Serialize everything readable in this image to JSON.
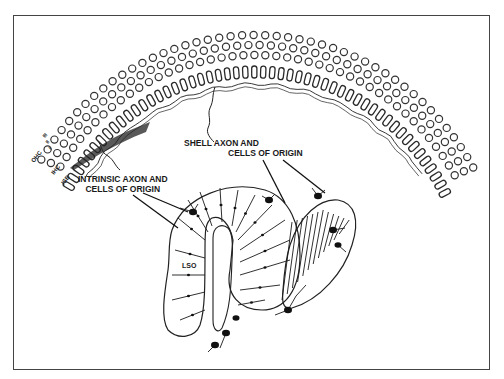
{
  "figure": {
    "type": "schematic diagram",
    "colors": {
      "ink": "#1a1a1a",
      "frame": "#444444",
      "background": "#ffffff"
    }
  },
  "labels": {
    "ohc": "OHC",
    "ohc_rows": [
      "III",
      "II",
      "I"
    ],
    "ihc": "IHC",
    "isb": "ISB",
    "lso": "LSO",
    "shell_line1": "SHELL AXON AND",
    "shell_line2": "CELLS OF ORIGIN",
    "intrinsic_line1": "INTRINSIC AXON AND",
    "intrinsic_line2": "CELLS OF ORIGIN"
  }
}
